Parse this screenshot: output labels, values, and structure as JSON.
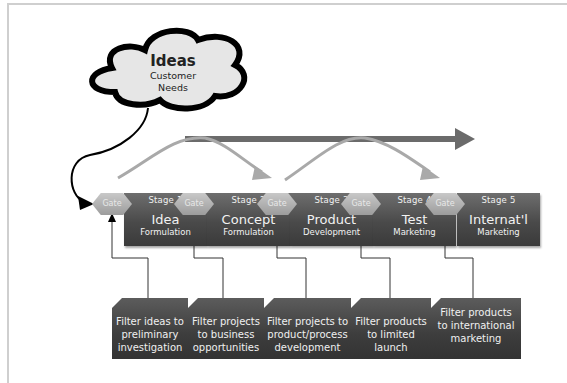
{
  "cloud": {
    "title": "Ideas",
    "subtitle_line1": "Customer",
    "subtitle_line2": "Needs"
  },
  "gates": [
    {
      "label": "Gate"
    },
    {
      "label": "Gate"
    },
    {
      "label": "Gate"
    },
    {
      "label": "Gate"
    },
    {
      "label": "Gate"
    }
  ],
  "stages": [
    {
      "label": "Stage 1",
      "title": "Idea",
      "subtitle": "Formulation"
    },
    {
      "label": "Stage 2",
      "title": "Concept",
      "subtitle": "Formulation"
    },
    {
      "label": "Stage 3",
      "title": "Product",
      "subtitle": "Development"
    },
    {
      "label": "Stage 4",
      "title": "Test",
      "subtitle": "Marketing"
    },
    {
      "label": "Stage 5",
      "title": "Internat'l",
      "subtitle": "Marketing"
    }
  ],
  "filters": [
    {
      "line1": "Filter ideas to",
      "line2": "preliminary",
      "line3": "investigation"
    },
    {
      "line1": "Filter projects",
      "line2": "to business",
      "line3": "opportunities"
    },
    {
      "line1": "Filter projects to",
      "line2": "product/process",
      "line3": "development"
    },
    {
      "line1": "Filter products",
      "line2": "to limited",
      "line3": "launch"
    },
    {
      "line1": "Filter products",
      "line2": "to international",
      "line3": "marketing"
    }
  ],
  "colors": {
    "stage_box": "#4a4a4a",
    "gate": "#aaaaaa",
    "main_arrow": "#6b6b6b",
    "curved_arrows": "#a9a9a9",
    "connector": "#333333"
  }
}
